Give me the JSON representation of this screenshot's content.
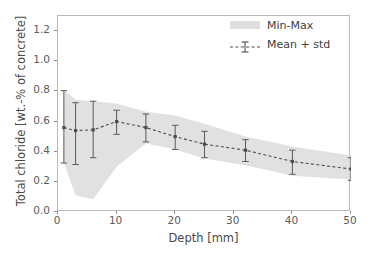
{
  "chart_data": {
    "type": "line",
    "title": "",
    "xlabel": "Depth [mm]",
    "ylabel": "Total chloride [wt.-% of concrete]",
    "xlim": [
      0,
      50
    ],
    "ylim": [
      0,
      1.3
    ],
    "xticks": [
      0,
      10,
      20,
      30,
      40,
      50
    ],
    "xtick_labels": [
      "0",
      "10",
      "20",
      "30",
      "40",
      "50"
    ],
    "yticks": [
      0.0,
      0.2,
      0.4,
      0.6,
      0.8,
      1.0,
      1.2
    ],
    "ytick_labels": [
      "0.0",
      "0.2",
      "0.4",
      "0.6",
      "0.8",
      "1.0",
      "1.2"
    ],
    "grid": false,
    "legend_position": "upper right",
    "legend": [
      "Min-Max",
      "Mean + std"
    ],
    "x": [
      1,
      3,
      6,
      10,
      15,
      20,
      25,
      32,
      40,
      50
    ],
    "series": [
      {
        "name": "Mean + std",
        "style": "dashed-line-with-errorbars",
        "color": "#4d4d4d",
        "values": [
          0.56,
          0.54,
          0.545,
          0.6,
          0.56,
          0.5,
          0.45,
          0.41,
          0.335,
          0.285
        ],
        "err_low": [
          0.235,
          0.225,
          0.185,
          0.085,
          0.095,
          0.085,
          0.09,
          0.075,
          0.085,
          0.075
        ],
        "err_high": [
          0.245,
          0.185,
          0.19,
          0.075,
          0.09,
          0.075,
          0.085,
          0.07,
          0.075,
          0.075
        ]
      },
      {
        "name": "Min-Max",
        "style": "filled-band",
        "color": "#d9d9d9",
        "min": [
          0.33,
          0.11,
          0.085,
          0.3,
          0.455,
          0.415,
          0.355,
          0.31,
          0.24,
          0.215
        ],
        "max": [
          0.81,
          0.745,
          0.735,
          0.72,
          0.665,
          0.64,
          0.585,
          0.5,
          0.435,
          0.375
        ]
      }
    ]
  },
  "axis_titles": {
    "x": "Depth [mm]",
    "y": "Total chloride [wt.-% of concrete]"
  },
  "legend": {
    "items": [
      {
        "label": "Min-Max",
        "key": "band-swatch"
      },
      {
        "label": "Mean + std",
        "key": "errorbar-line-sample"
      }
    ]
  }
}
